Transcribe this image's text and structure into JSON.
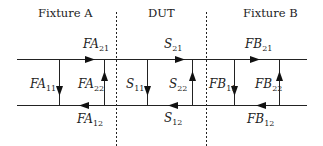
{
  "diagram": {
    "sections": [
      {
        "name": "Fixture A"
      },
      {
        "name": "DUT"
      },
      {
        "name": "Fixture B"
      }
    ],
    "colors": {
      "line": "#222222",
      "background": "#ffffff"
    },
    "labels": {
      "FA21": {
        "base": "FA",
        "sub": "21"
      },
      "FA11": {
        "base": "FA",
        "sub": "11"
      },
      "FA22": {
        "base": "FA",
        "sub": "22"
      },
      "FA12": {
        "base": "FA",
        "sub": "12"
      },
      "S21": {
        "base": "S",
        "sub": "21"
      },
      "S11": {
        "base": "S",
        "sub": "11"
      },
      "S22": {
        "base": "S",
        "sub": "22"
      },
      "S12": {
        "base": "S",
        "sub": "12"
      },
      "FB21": {
        "base": "FB",
        "sub": "21"
      },
      "FB11": {
        "base": "FB",
        "sub": "11"
      },
      "FB22": {
        "base": "FB",
        "sub": "22"
      },
      "FB12": {
        "base": "FB",
        "sub": "12"
      }
    }
  }
}
